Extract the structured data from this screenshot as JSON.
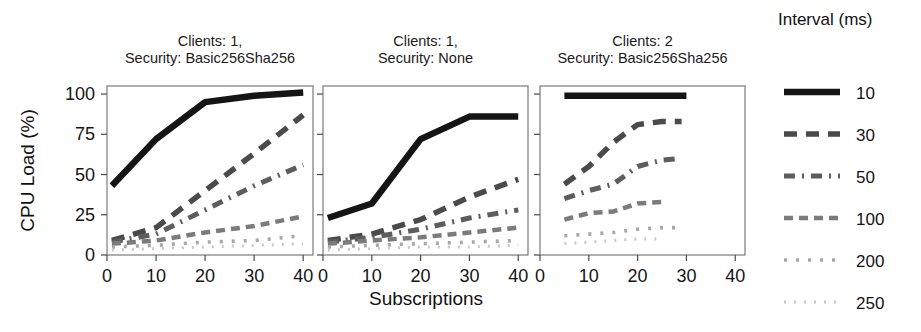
{
  "figure": {
    "xlabel": "Subscriptions",
    "ylabel": "CPU Load (%)",
    "legend_title": "Interval (ms)"
  },
  "axes": {
    "x_ticks": [
      "0",
      "10",
      "20",
      "30",
      "40"
    ],
    "y_ticks": [
      "0",
      "25",
      "50",
      "75",
      "100"
    ],
    "xlim": [
      0,
      42
    ],
    "ylim": [
      0,
      105
    ]
  },
  "legend": {
    "title": "Interval (ms)",
    "entries": [
      {
        "label": "10",
        "color": "#151515",
        "width": 6.5,
        "dash": "none"
      },
      {
        "label": "30",
        "color": "#4a4a4a",
        "width": 5.5,
        "dash": "13,9"
      },
      {
        "label": "50",
        "color": "#5d5d5d",
        "width": 5.0,
        "dash": "11,7,2,7"
      },
      {
        "label": "100",
        "color": "#7b7b7b",
        "width": 4.5,
        "dash": "9,6"
      },
      {
        "label": "200",
        "color": "#a8a8a8",
        "width": 3.6,
        "dash": "3,9"
      },
      {
        "label": "250",
        "color": "#c9c9c9",
        "width": 3.0,
        "dash": "2,8"
      }
    ]
  },
  "chart_data": {
    "type": "line",
    "title": "",
    "xlabel": "Subscriptions",
    "ylabel": "CPU Load (%)",
    "xlim": [
      0,
      42
    ],
    "ylim": [
      0,
      105
    ],
    "grid": false,
    "legend_position": "right",
    "legend_title": "Interval (ms)",
    "panels": [
      {
        "title_line1": "Clients: 1,",
        "title_line2": "Security: Basic256Sha256",
        "series": [
          {
            "name": "10",
            "x": [
              1,
              10,
              20,
              30,
              40
            ],
            "y": [
              43,
              72,
              95,
              99,
              101
            ]
          },
          {
            "name": "30",
            "x": [
              1,
              10,
              20,
              30,
              40
            ],
            "y": [
              9,
              17,
              40,
              63,
              87
            ]
          },
          {
            "name": "50",
            "x": [
              1,
              10,
              20,
              30,
              40
            ],
            "y": [
              8,
              13,
              28,
              43,
              56
            ]
          },
          {
            "name": "100",
            "x": [
              1,
              10,
              20,
              30,
              40
            ],
            "y": [
              7,
              9,
              14,
              18,
              24
            ]
          },
          {
            "name": "200",
            "x": [
              1,
              10,
              20,
              30,
              40
            ],
            "y": [
              5,
              6,
              8,
              9,
              12
            ]
          },
          {
            "name": "250",
            "x": [
              1,
              10,
              20,
              30,
              40
            ],
            "y": [
              3,
              4,
              5,
              6,
              7
            ]
          }
        ]
      },
      {
        "title_line1": "Clients: 1,",
        "title_line2": "Security: None",
        "series": [
          {
            "name": "10",
            "x": [
              1,
              10,
              20,
              30,
              40
            ],
            "y": [
              23,
              32,
              72,
              86,
              86
            ]
          },
          {
            "name": "30",
            "x": [
              1,
              10,
              20,
              30,
              40
            ],
            "y": [
              9,
              13,
              22,
              36,
              47
            ]
          },
          {
            "name": "50",
            "x": [
              1,
              10,
              20,
              30,
              40
            ],
            "y": [
              8,
              11,
              16,
              23,
              28
            ]
          },
          {
            "name": "100",
            "x": [
              1,
              10,
              20,
              30,
              40
            ],
            "y": [
              7,
              9,
              11,
              14,
              17
            ]
          },
          {
            "name": "200",
            "x": [
              1,
              10,
              20,
              30,
              40
            ],
            "y": [
              5,
              6,
              7,
              8,
              9
            ]
          },
          {
            "name": "250",
            "x": [
              1,
              10,
              20,
              30,
              40
            ],
            "y": [
              3,
              4,
              5,
              5,
              6
            ]
          }
        ]
      },
      {
        "title_line1": "Clients: 2",
        "title_line2": "Security: Basic256Sha256",
        "series": [
          {
            "name": "10",
            "x": [
              5,
              10,
              20,
              30
            ],
            "y": [
              99,
              99,
              99,
              99
            ]
          },
          {
            "name": "30",
            "x": [
              5,
              10,
              15,
              20,
              25,
              29
            ],
            "y": [
              44,
              55,
              70,
              81,
              83,
              83
            ]
          },
          {
            "name": "50",
            "x": [
              5,
              10,
              15,
              20,
              25,
              29
            ],
            "y": [
              35,
              40,
              44,
              55,
              59,
              60
            ]
          },
          {
            "name": "100",
            "x": [
              5,
              10,
              15,
              20,
              25
            ],
            "y": [
              22,
              26,
              27,
              32,
              33
            ]
          },
          {
            "name": "200",
            "x": [
              5,
              10,
              15,
              20,
              25,
              28
            ],
            "y": [
              12,
              13,
              14,
              16,
              17,
              17
            ]
          },
          {
            "name": "250",
            "x": [
              5,
              10,
              15,
              20,
              25
            ],
            "y": [
              7,
              8,
              9,
              10,
              10
            ]
          }
        ]
      }
    ]
  }
}
